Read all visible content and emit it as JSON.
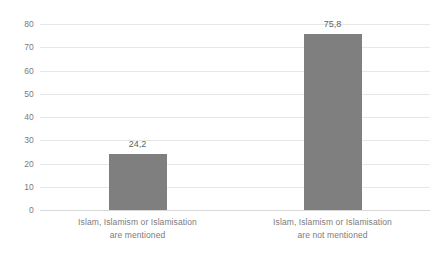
{
  "chart_data": {
    "type": "bar",
    "title": "",
    "subtitle": "",
    "xlabel": "",
    "ylabel": "",
    "categories": [
      "Islam, Islamism or Islamisation are mentioned",
      "Islam, Islamism or Islamisation are not mentioned"
    ],
    "category_lines": [
      [
        "Islam, Islamism or Islamisation",
        "are mentioned"
      ],
      [
        "Islam, Islamism or Islamisation",
        "are not mentioned"
      ]
    ],
    "values": [
      24.2,
      75.8
    ],
    "value_labels": [
      "24,2",
      "75,8"
    ],
    "ylim": [
      0,
      80
    ],
    "yticks": [
      0,
      10,
      20,
      30,
      40,
      50,
      60,
      70,
      80
    ],
    "ytick_labels": [
      "0",
      "10",
      "20",
      "30",
      "40",
      "50",
      "60",
      "70",
      "80"
    ],
    "grid": true,
    "legend": false,
    "legend_position": "none",
    "series": [
      {
        "name": "",
        "values": [
          24.2,
          75.8
        ]
      }
    ]
  },
  "style": {
    "bar_color": "#7f7f7f",
    "gridline_color": "#e6e6e6",
    "axis_color": "#d9d9d9",
    "tick_text_color": "#7b7b7b",
    "value_text_color": "#5f5f5f",
    "background": "#ffffff"
  }
}
